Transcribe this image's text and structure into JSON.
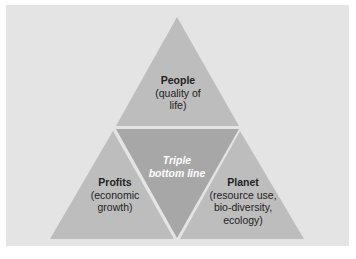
{
  "diagram": {
    "type": "triangle-segmentation",
    "colors": {
      "background": "#e4e4e4",
      "outer_triangle": "#bdbdbd",
      "center_triangle": "#a7a7a7",
      "divider": "#f2f2f2",
      "text": "#222222",
      "center_text": "#ffffff"
    },
    "center": {
      "line1": "Triple",
      "line2": "bottom line"
    },
    "segments": [
      {
        "id": "people",
        "title": "People",
        "lines": [
          "(quality of",
          "life)"
        ]
      },
      {
        "id": "profits",
        "title": "Profits",
        "lines": [
          "(economic",
          "growth)"
        ]
      },
      {
        "id": "planet",
        "title": "Planet",
        "lines": [
          "(resource use,",
          "bio-diversity,",
          "ecology)"
        ]
      }
    ]
  }
}
